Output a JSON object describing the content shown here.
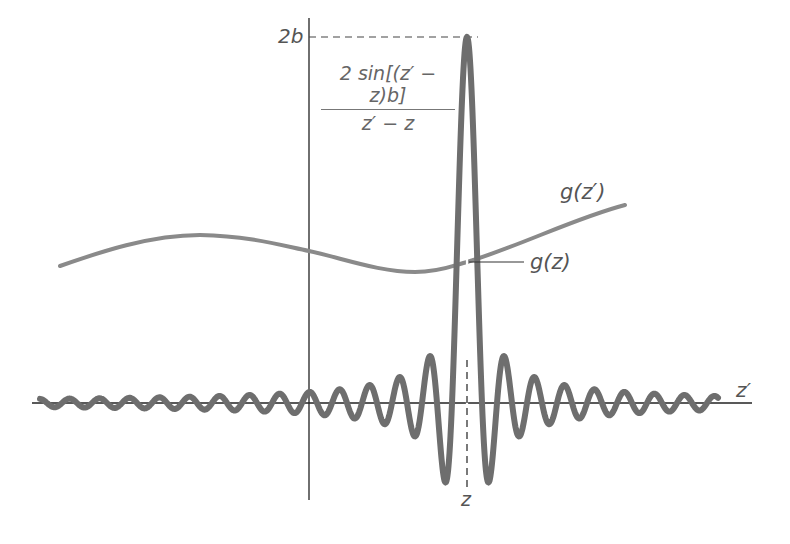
{
  "figure": {
    "labels": {
      "peak_value": "2b",
      "kernel_formula_numerator": "2 sin[(z′ − z)b]",
      "kernel_formula_denominator": "z′ − z",
      "smooth_function": "g(z′)",
      "function_at_point": "g(z)",
      "horizontal_axis": "z′",
      "center_point": "z"
    },
    "colors": {
      "kernel_curve": "#6e6e6e",
      "smooth_curve": "#8a8a8a",
      "axes": "#222222",
      "text": "#555555"
    }
  },
  "chart_data": {
    "type": "line",
    "title": "",
    "xlabel": "z′",
    "ylabel": "",
    "grid": false,
    "series": [
      {
        "name": "2 sin[(z′ − z)b] / (z′ − z)",
        "description": "sinc-like kernel centered at z′ = z with peak height 2b, oscillating and decaying on both sides",
        "peak_at": "z",
        "peak_value": "2b"
      },
      {
        "name": "g(z′)",
        "description": "slowly varying smooth function; marked value g(z) at z′ = z"
      }
    ],
    "annotations": [
      "2b",
      "g(z)",
      "z"
    ],
    "reference_lines": [
      {
        "type": "horizontal-dashed",
        "at": "2b"
      },
      {
        "type": "vertical-dashed",
        "at": "z"
      }
    ]
  }
}
